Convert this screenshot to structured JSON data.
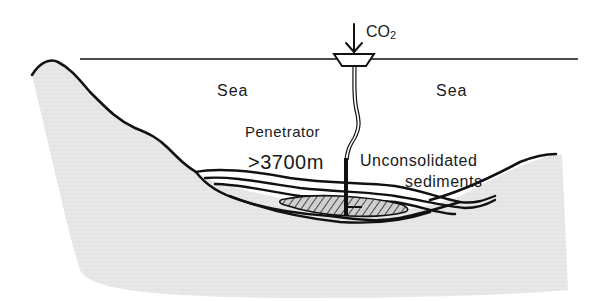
{
  "diagram": {
    "labels": {
      "co2_main": "CO",
      "co2_sub": "2",
      "sea_left": "Sea",
      "sea_right": "Sea",
      "penetrator": "Penetrator",
      "depth": ">3700m",
      "sediments_line1": "Unconsolidated",
      "sediments_line2": "sediments"
    },
    "elements": [
      "sea-surface-line",
      "injection-vessel",
      "co2-input-arrow",
      "pipe",
      "penetrator-rod",
      "seabed-landmass",
      "sediment-layers",
      "co2-pool"
    ],
    "colors": {
      "line": "#111111",
      "land_fill": "#e6e6e6",
      "background": "#ffffff",
      "co2_pool_fill": "#9a9a9a"
    }
  }
}
